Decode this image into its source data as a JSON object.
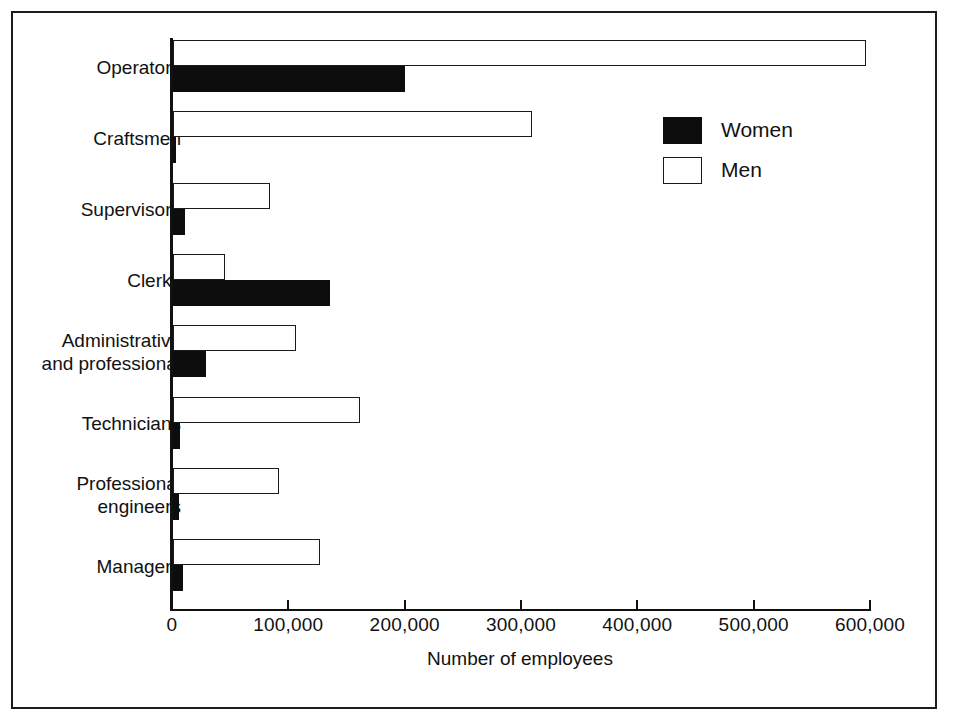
{
  "chart_data": {
    "type": "bar",
    "orientation": "horizontal",
    "title": "",
    "subtitle": "",
    "xlabel": "Number of employees",
    "ylabel": "",
    "xlim": [
      0,
      600000
    ],
    "xticks": [
      0,
      100000,
      200000,
      300000,
      400000,
      500000,
      600000
    ],
    "xtick_labels": [
      "0",
      "100,000",
      "200,000",
      "300,000",
      "400,000",
      "500,000",
      "600,000"
    ],
    "grid": false,
    "legend_position": "upper right",
    "categories": [
      "Operators",
      "Craftsmen",
      "Supervisors",
      "Clerks",
      "Administrative\nand professional",
      "Technicians",
      "Professional\nengineers",
      "Managers"
    ],
    "series": [
      {
        "name": "Men",
        "color": "#ffffff",
        "edge_color": "#1a1a1a",
        "values": [
          596000,
          309000,
          83000,
          45000,
          106000,
          161000,
          91000,
          126000
        ]
      },
      {
        "name": "Women",
        "color": "#0d0d0d",
        "edge_color": "#0d0d0d",
        "values": [
          199000,
          3000,
          10000,
          135000,
          28000,
          6000,
          5000,
          9000
        ]
      }
    ]
  },
  "axis": {
    "xlabel": "Number of employees",
    "tick_labels": [
      "0",
      "100,000",
      "200,000",
      "300,000",
      "400,000",
      "500,000",
      "600,000"
    ]
  },
  "categories": [
    {
      "line1": "Operators",
      "line2": ""
    },
    {
      "line1": "Craftsmen",
      "line2": ""
    },
    {
      "line1": "Supervisors",
      "line2": ""
    },
    {
      "line1": "Clerks",
      "line2": ""
    },
    {
      "line1": "Administrative",
      "line2": "and professional"
    },
    {
      "line1": "Technicians",
      "line2": ""
    },
    {
      "line1": "Professional",
      "line2": "engineers"
    },
    {
      "line1": "Managers",
      "line2": ""
    }
  ],
  "legend": {
    "items": [
      {
        "label": "Women",
        "swatch": "filled-black"
      },
      {
        "label": "Men",
        "swatch": "outline-white"
      }
    ]
  }
}
